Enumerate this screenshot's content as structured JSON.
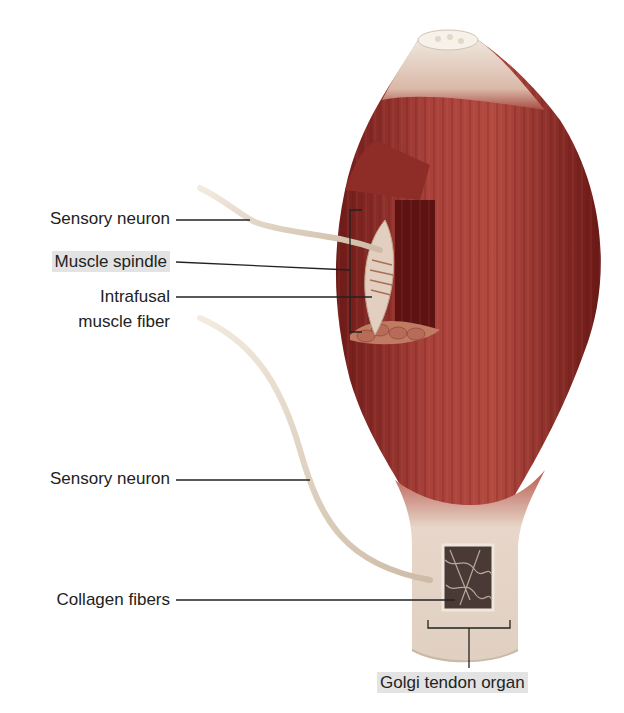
{
  "figure": {
    "colors": {
      "muscle_dark": "#7a1f1c",
      "muscle_mid": "#a83a32",
      "muscle_light": "#c9665a",
      "tendon": "#e8ddd2",
      "nerve": "#e9dccb",
      "label_highlight": "#e3e3e3",
      "leader_line": "#222222"
    }
  },
  "labels": {
    "sensory_neuron_top": "Sensory neuron",
    "muscle_spindle": "Muscle spindle",
    "intrafusal_line1": "Intrafusal",
    "intrafusal_line2": "muscle fiber",
    "sensory_neuron_bottom": "Sensory neuron",
    "collagen_fibers": "Collagen fibers",
    "golgi_tendon_organ": "Golgi tendon organ"
  }
}
